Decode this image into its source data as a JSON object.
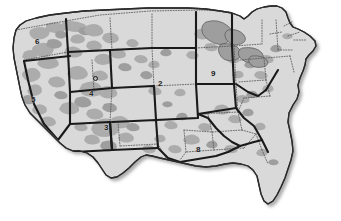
{
  "map": {
    "title": "United States regional map",
    "projection_note": "contiguous united states",
    "colors": {
      "background": "#ffffff",
      "land_fill": "#d9d9d9",
      "patch_fill": "#a9a9a9",
      "patch_fill_dark": "#9a9a9a",
      "lake_fill": "#9e9e9e",
      "region_border": "#1a1a1a",
      "state_border": "#555555",
      "coastline": "#2b2b2b",
      "shadow": "#b5b5b5",
      "label_text": "#1a1a1a"
    },
    "styles": {
      "region_border_desc": "thick solid black",
      "state_border_desc": "fine dotted gray",
      "outline_desc": "solid dark outline with drop shadow to lower-right"
    },
    "region_labels": [
      {
        "id": "region-2",
        "text": "2",
        "x": 160,
        "y": 84,
        "area": "central rockies / plains"
      },
      {
        "id": "region-3",
        "text": "3",
        "x": 106,
        "y": 128,
        "area": "southwest"
      },
      {
        "id": "region-4",
        "text": "4",
        "x": 91,
        "y": 94,
        "area": "great basin"
      },
      {
        "id": "region-5",
        "text": "5",
        "x": 33,
        "y": 100,
        "area": "pacific southwest"
      },
      {
        "id": "region-6",
        "text": "6",
        "x": 37,
        "y": 42,
        "area": "pacific northwest"
      },
      {
        "id": "region-8",
        "text": "8",
        "x": 198,
        "y": 150,
        "area": "south central gulf"
      },
      {
        "id": "region-9",
        "text": "9",
        "x": 213,
        "y": 74,
        "area": "upper midwest"
      }
    ],
    "markers": [
      {
        "id": "marker-utah",
        "x": 95,
        "y": 78,
        "shape": "circle-outline"
      }
    ]
  }
}
